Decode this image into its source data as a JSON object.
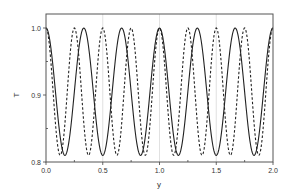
{
  "chart_data": {
    "type": "line",
    "title": "",
    "xlabel": "y",
    "ylabel": "T",
    "xlim": [
      0.0,
      2.0
    ],
    "ylim": [
      0.8,
      1.0
    ],
    "x_ticks": [
      "0.0",
      "0.5",
      "1.0",
      "1.5",
      "2.0"
    ],
    "y_ticks": [
      "0.8",
      "0.9",
      "1.0"
    ],
    "grid": "vertical gridlines at major x ticks",
    "legend": "none",
    "series": [
      {
        "name": "solid",
        "style": "solid",
        "description": "periodic cosine, period 1/3, oscillating between 1.0 and ~0.81",
        "period": 0.3333,
        "max": 1.0,
        "min": 0.81,
        "peaks_x": [
          0.0,
          0.333,
          0.667,
          1.0,
          1.333,
          1.667,
          2.0
        ],
        "troughs_x": [
          0.167,
          0.5,
          0.833,
          1.167,
          1.5,
          1.833
        ]
      },
      {
        "name": "dashed",
        "style": "dashed",
        "description": "periodic cosine, period 0.25, oscillating between 1.0 and ~0.81",
        "period": 0.25,
        "max": 1.0,
        "min": 0.81,
        "peaks_x": [
          0.0,
          0.25,
          0.5,
          0.75,
          1.0,
          1.25,
          1.5,
          1.75,
          2.0
        ],
        "troughs_x": [
          0.125,
          0.375,
          0.625,
          0.875,
          1.125,
          1.375,
          1.625,
          1.875
        ]
      }
    ]
  },
  "colors": {
    "axis": "#444444",
    "grid": "#cccccc",
    "line": "#222222"
  }
}
